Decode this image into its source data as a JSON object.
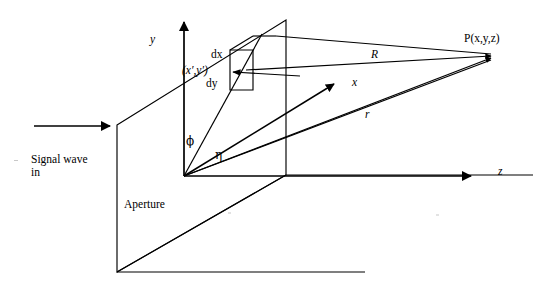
{
  "diagram": {
    "background_color": "#ffffff",
    "stroke_color": "#000000",
    "axes": [
      {
        "name": "y",
        "label": "y",
        "direction": "up",
        "arrow": true
      },
      {
        "name": "z",
        "label": "z",
        "direction": "right",
        "arrow": true
      },
      {
        "name": "x",
        "label": "x",
        "direction": "up-right-oblique",
        "arrow": true
      }
    ],
    "labels": {
      "y_axis": "y",
      "z_axis": "z",
      "x_axis": "x",
      "point_p": "P(x,y,z)",
      "vector_R": "R",
      "vector_r": "r",
      "angle_phi": "ϕ",
      "angle_eta": "η",
      "source_point": "(x′,y′)",
      "element_dx": "dx",
      "element_dy": "dy",
      "aperture": "Aperture",
      "incoming_wave_line1": "Signal wave",
      "incoming_wave_line2": "in"
    },
    "geometry": {
      "origin": [
        184,
        176
      ],
      "y_axis_tip": [
        184,
        18
      ],
      "z_axis_tip": [
        475,
        176
      ],
      "x_axis_tip": [
        337,
        82
      ],
      "point_p": [
        493,
        56
      ],
      "aperture_plane": [
        [
          117,
          125
        ],
        [
          286,
          20
        ],
        [
          286,
          175
        ],
        [
          117,
          272
        ]
      ],
      "ground_plane": [
        [
          117,
          272
        ],
        [
          286,
          175
        ],
        [
          533,
          175
        ]
      ],
      "differential_element": [
        [
          230,
          50
        ],
        [
          253,
          50
        ],
        [
          253,
          90
        ],
        [
          230,
          90
        ]
      ],
      "incoming_arrow": [
        [
          34,
          126
        ],
        [
          113,
          126
        ]
      ]
    }
  }
}
